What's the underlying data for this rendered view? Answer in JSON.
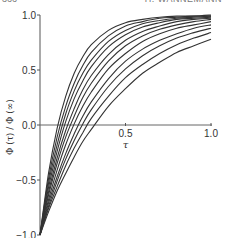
{
  "page": {
    "page_number": "366",
    "running_header": "H. WANNEMANN"
  },
  "chart_data": {
    "type": "line",
    "title": "",
    "xlabel": "τ",
    "ylabel": "Φ (τ) / Φ (∞)",
    "xlim": [
      0,
      1.0
    ],
    "ylim": [
      -1.0,
      1.0
    ],
    "x_ticks": [
      0.5,
      1.0
    ],
    "x_tick_labels": [
      "0.5",
      "1.0"
    ],
    "y_ticks": [
      -1.0,
      -0.5,
      0.0,
      0.5,
      1.0
    ],
    "y_tick_labels": [
      "-1.0",
      "-0.5",
      "0.0",
      "0.5",
      "1.0"
    ],
    "grid": false,
    "legend": null,
    "x": [
      0.0,
      0.05,
      0.1,
      0.15,
      0.2,
      0.25,
      0.3,
      0.4,
      0.5,
      0.6,
      0.7,
      0.8,
      0.9,
      1.0
    ],
    "series": [
      {
        "name": "curve-1",
        "values": [
          -1.0,
          -0.44,
          -0.03,
          0.26,
          0.47,
          0.62,
          0.73,
          0.86,
          0.93,
          0.96,
          0.98,
          0.99,
          0.99,
          1.0
        ]
      },
      {
        "name": "curve-2",
        "values": [
          -1.0,
          -0.49,
          -0.11,
          0.17,
          0.38,
          0.54,
          0.66,
          0.81,
          0.9,
          0.94,
          0.97,
          0.98,
          0.99,
          0.99
        ]
      },
      {
        "name": "curve-3",
        "values": [
          -1.0,
          -0.53,
          -0.18,
          0.1,
          0.31,
          0.47,
          0.59,
          0.76,
          0.86,
          0.92,
          0.95,
          0.97,
          0.98,
          0.99
        ]
      },
      {
        "name": "curve-4",
        "values": [
          -1.0,
          -0.57,
          -0.24,
          0.03,
          0.24,
          0.4,
          0.53,
          0.71,
          0.82,
          0.89,
          0.93,
          0.96,
          0.97,
          0.98
        ]
      },
      {
        "name": "curve-5",
        "values": [
          -1.0,
          -0.61,
          -0.3,
          -0.05,
          0.15,
          0.32,
          0.45,
          0.64,
          0.77,
          0.85,
          0.9,
          0.94,
          0.96,
          0.97
        ]
      },
      {
        "name": "curve-6",
        "values": [
          -1.0,
          -0.64,
          -0.35,
          -0.11,
          0.08,
          0.25,
          0.38,
          0.58,
          0.72,
          0.81,
          0.87,
          0.91,
          0.94,
          0.96
        ]
      },
      {
        "name": "curve-7",
        "values": [
          -1.0,
          -0.68,
          -0.41,
          -0.18,
          0.01,
          0.17,
          0.3,
          0.51,
          0.65,
          0.76,
          0.83,
          0.88,
          0.91,
          0.94
        ]
      },
      {
        "name": "curve-8",
        "values": [
          -1.0,
          -0.71,
          -0.47,
          -0.26,
          -0.08,
          0.08,
          0.21,
          0.42,
          0.58,
          0.69,
          0.77,
          0.83,
          0.88,
          0.91
        ]
      },
      {
        "name": "curve-9",
        "values": [
          -1.0,
          -0.74,
          -0.51,
          -0.31,
          -0.14,
          0.01,
          0.14,
          0.35,
          0.51,
          0.63,
          0.72,
          0.79,
          0.84,
          0.88
        ]
      },
      {
        "name": "curve-10",
        "values": [
          -1.0,
          -0.76,
          -0.56,
          -0.37,
          -0.21,
          -0.07,
          0.06,
          0.26,
          0.43,
          0.55,
          0.65,
          0.73,
          0.79,
          0.84
        ]
      },
      {
        "name": "curve-11",
        "values": [
          -1.0,
          -0.79,
          -0.6,
          -0.44,
          -0.29,
          -0.15,
          -0.04,
          0.17,
          0.33,
          0.47,
          0.57,
          0.66,
          0.72,
          0.78
        ]
      }
    ]
  }
}
